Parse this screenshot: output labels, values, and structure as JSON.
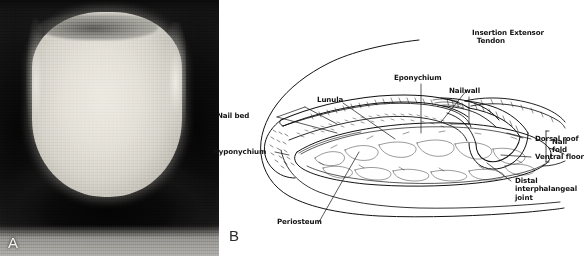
{
  "figure": {
    "panel_a": {
      "letter": "A",
      "caption_kind": "photograph-of-fingernail"
    },
    "panel_b": {
      "letter": "B",
      "caption_kind": "sagittal-line-drawing-of-fingertip",
      "labels": [
        {
          "id": "nail-bed",
          "text": "Nail bed"
        },
        {
          "id": "lunula",
          "text": "Lunula"
        },
        {
          "id": "eponychium",
          "text": "Eponychium"
        },
        {
          "id": "nailwall",
          "text": "Nailwall"
        },
        {
          "id": "insertion-extensor-tendon",
          "text": "Insertion Extensor\n  Tendon"
        },
        {
          "id": "dorsal-roof",
          "text": "Dorsal roof"
        },
        {
          "id": "ventral-floor",
          "text": "Ventral floor"
        },
        {
          "id": "nail-fold",
          "text": "Nail\nfold"
        },
        {
          "id": "distal-interphalangeal-joint",
          "text": "Distal\ninterphalangeal\njoint"
        },
        {
          "id": "hyponychium",
          "text": "Hyponychium"
        },
        {
          "id": "periosteum",
          "text": "Periosteum"
        }
      ]
    }
  },
  "colors": {
    "background": "#ffffff",
    "ink": "#131313",
    "panel_a_letter": "#f2f1ec",
    "panel_b_letter": "#2b2b2b"
  }
}
